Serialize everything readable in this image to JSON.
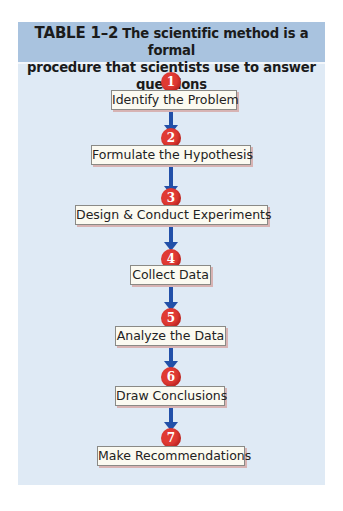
{
  "header": {
    "label": "TABLE 1–2",
    "line1": "The scientific method is a formal",
    "line2": "procedure that scientists use to answer questions"
  },
  "colors": {
    "header_bg": "#a9c3df",
    "panel_bg": "#dfeaf5",
    "circle": "#e03a33",
    "arrow": "#2250a8",
    "box_bg": "#fbfaf1",
    "box_shadow": "#d7b3b3"
  },
  "steps": [
    {
      "number": "1",
      "label": "Identify the Problem"
    },
    {
      "number": "2",
      "label": "Formulate the Hypothesis"
    },
    {
      "number": "3",
      "label": "Design & Conduct Experiments"
    },
    {
      "number": "4",
      "label": "Collect Data"
    },
    {
      "number": "5",
      "label": "Analyze the Data"
    },
    {
      "number": "6",
      "label": "Draw Conclusions"
    },
    {
      "number": "7",
      "label": "Make Recommendations"
    }
  ]
}
